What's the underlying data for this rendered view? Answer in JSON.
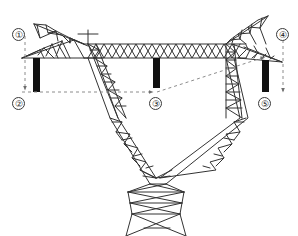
{
  "figure": {
    "background_color": "#ffffff",
    "line_color": "#333333",
    "dimension_line_color": "#8c8c8c",
    "insulator_color": "#111111",
    "width": 298,
    "height": 236
  },
  "callouts": [
    {
      "id": "1",
      "label": "①",
      "x": 10,
      "y": 28,
      "refers_to": "top-of-tower-level"
    },
    {
      "id": "2",
      "label": "②",
      "x": 10,
      "y": 96,
      "refers_to": "left-conductor-level"
    },
    {
      "id": "3",
      "label": "③",
      "x": 148,
      "y": 96,
      "refers_to": "center-conductor-level"
    },
    {
      "id": "4",
      "label": "④",
      "x": 274,
      "y": 28,
      "refers_to": "right-upper-conductor-level"
    },
    {
      "id": "5",
      "label": "⑤",
      "x": 258,
      "y": 96,
      "refers_to": "right-lower-conductor-level"
    }
  ],
  "insulators": [
    {
      "name": "left-insulator-string",
      "x": 36,
      "y_top": 58,
      "y_bottom": 92,
      "width": 6
    },
    {
      "name": "center-insulator-string",
      "x": 156,
      "y_top": 58,
      "y_bottom": 88,
      "width": 6
    },
    {
      "name": "right-insulator-string",
      "x": 265,
      "y_top": 60,
      "y_bottom": 92,
      "width": 6
    }
  ],
  "dimension_lines": {
    "vertical_left": {
      "x": 38,
      "y_top": 36,
      "y_bottom": 90,
      "arrow": "down"
    },
    "vertical_right": {
      "x": 285,
      "y_top": 38,
      "y_bottom": 92,
      "arrow": "down"
    },
    "horizontal_main": {
      "y": 92,
      "x_start": 20,
      "x_end": 156,
      "arrow": "right"
    },
    "diagonal_to_right": {
      "x_start": 156,
      "y_start": 92,
      "x_end": 266,
      "y_end": 56,
      "arrow": "up-right"
    }
  },
  "structure": {
    "crossarm_top_y": 46,
    "crossarm_lower_y": 58,
    "left_peak": {
      "x": 34,
      "y": 24
    },
    "right_peak": {
      "x": 268,
      "y": 16
    },
    "waist_center": {
      "x": 156,
      "y": 178
    },
    "base_y": 236
  }
}
